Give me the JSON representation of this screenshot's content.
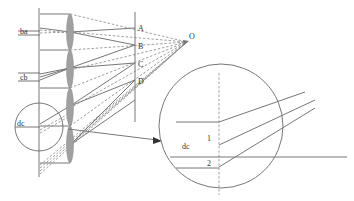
{
  "figure": {
    "labels": {
      "ba": "ba",
      "cb": "cb",
      "dc_small": "dc",
      "A": "A",
      "B": "B",
      "C": "C",
      "D": "D",
      "O": "O",
      "dc_large": "dc",
      "one": "1",
      "two": "2"
    },
    "colors": {
      "line": "#777777",
      "dashed": "#888888",
      "lens_fill": "#a0a0a0",
      "text": "#333333",
      "background": "#ffffff"
    },
    "components": {
      "image_plane": "vertical line at left",
      "lens_array": 4,
      "projection_plane": "vertical line with points A, B, C, D",
      "focal_point": "O",
      "magnified_inset": "circle showing detail of region dc with points 1 and 2"
    }
  }
}
